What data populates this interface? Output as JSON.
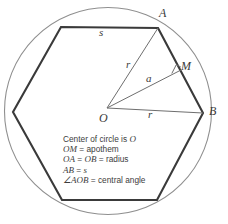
{
  "figure": {
    "shape": "hexagon",
    "colors": {
      "circle_stroke": "#8a8a8a",
      "polygon_stroke": "#3a3a3a",
      "ray_stroke": "#6b6b6b",
      "text": "#3d3d3d",
      "background": "#ffffff"
    },
    "circle": {
      "cx": 108,
      "cy": 111,
      "r": 103.5
    },
    "points": {
      "O": {
        "x": 107,
        "y": 108,
        "label": "O",
        "label_x": 100,
        "label_y": 112
      },
      "A": {
        "x": 158,
        "y": 28,
        "label": "A",
        "label_x": 160,
        "label_y": 8
      },
      "B": {
        "x": 203,
        "y": 113,
        "label": "B",
        "label_x": 209,
        "label_y": 106
      },
      "M": {
        "x": 181,
        "y": 70,
        "label": "M",
        "label_x": 181,
        "label_y": 61
      }
    },
    "polygon_vertices": [
      {
        "x": 158,
        "y": 28
      },
      {
        "x": 203,
        "y": 113
      },
      {
        "x": 157,
        "y": 200
      },
      {
        "x": 62,
        "y": 200
      },
      {
        "x": 13,
        "y": 112
      },
      {
        "x": 61,
        "y": 27
      }
    ],
    "segment_labels": [
      {
        "name": "side-label-s",
        "text": "s",
        "x": 99,
        "y": 28
      },
      {
        "name": "radius-label-r-oa",
        "text": "r",
        "x": 126,
        "y": 60
      },
      {
        "name": "apothem-label-a",
        "text": "a",
        "x": 146,
        "y": 74
      },
      {
        "name": "radius-label-r-ob",
        "text": "r",
        "x": 148,
        "y": 110
      }
    ],
    "right_angle_marker": {
      "x": 175,
      "y": 76,
      "size": 7
    }
  },
  "legend": {
    "lines": [
      {
        "id": "line-center",
        "prefix_italic": "",
        "text": "Center of circle is ",
        "suffix_italic": "O"
      },
      {
        "id": "line-apothem",
        "prefix_italic": "OM",
        "text": " = apothem",
        "suffix_italic": ""
      },
      {
        "id": "line-radius",
        "prefix_italic": "OA",
        "text": " = ",
        "mid_italic": "OB",
        "text2": " = radius",
        "suffix_italic": ""
      },
      {
        "id": "line-side",
        "prefix_italic": "AB",
        "text": " = ",
        "suffix_italic": "s"
      },
      {
        "id": "line-angle",
        "prefix_italic": "∠AOB",
        "text": " = central angle",
        "suffix_italic": ""
      }
    ],
    "line_center_full": "Center of circle is O",
    "line_apothem_full": "OM = apothem",
    "line_radius_full": "OA = OB = radius",
    "line_side_full": "AB = s",
    "line_angle_full": "∠AOB = central angle"
  }
}
